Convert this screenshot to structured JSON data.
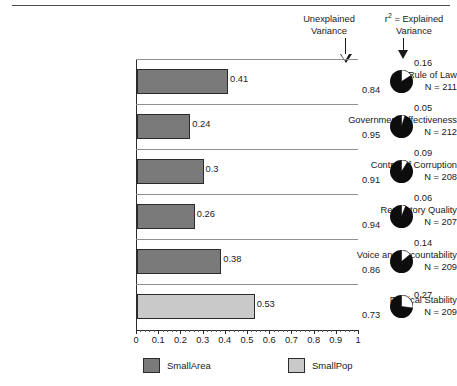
{
  "chart_data": {
    "type": "bar",
    "title": "",
    "xlabel": "",
    "ylabel": "",
    "xlim": [
      0,
      1
    ],
    "grid": true,
    "legend_position": "bottom",
    "categories": [
      "Rule of Law",
      "Government Effectiveness",
      "Control of Corruption",
      "Regulatory Quality",
      "Voice and Accountability",
      "Political Stability"
    ],
    "sample_sizes": [
      "N = 211",
      "N = 212",
      "N = 208",
      "N = 207",
      "N = 209",
      "N = 209"
    ],
    "values": [
      0.41,
      0.24,
      0.3,
      0.26,
      0.38,
      0.53
    ],
    "value_labels": [
      "0.41",
      "0.24",
      "0.3",
      "0.26",
      "0.38",
      "0.53"
    ],
    "series_of_row": [
      "SmallArea",
      "SmallArea",
      "SmallArea",
      "SmallArea",
      "SmallArea",
      "SmallPop"
    ],
    "explained_variance": [
      0.16,
      0.05,
      0.09,
      0.06,
      0.14,
      0.27
    ],
    "explained_labels": [
      "0.16",
      "0.05",
      "0.09",
      "0.06",
      "0.14",
      "0.27"
    ],
    "unexplained_variance": [
      0.84,
      0.95,
      0.91,
      0.94,
      0.86,
      0.73
    ],
    "unexplained_labels": [
      "0.84",
      "0.95",
      "0.91",
      "0.94",
      "0.86",
      "0.73"
    ],
    "xticks": [
      0,
      0.1,
      0.2,
      0.3,
      0.4,
      0.5,
      0.6,
      0.7,
      0.8,
      0.9,
      1
    ],
    "xtick_labels": [
      "0",
      "0.1",
      "0.2",
      "0.3",
      "0.4",
      "0.5",
      "0.6",
      "0.7",
      "0.8",
      "0.9",
      "1"
    ],
    "legend": [
      {
        "label": "SmallArea",
        "color": "#7a7a7a"
      },
      {
        "label": "SmallPop",
        "color": "#c9c9c9"
      }
    ],
    "colors": {
      "smallarea": "#7a7a7a",
      "smallpop": "#c9c9c9",
      "pie_unexplained": "#0d0d0d",
      "pie_explained": "#ffffff",
      "axis": "#2a2a2a",
      "gridline": "#8f8f8f"
    }
  },
  "annotations": {
    "unexplained": {
      "line1": "Unexplained",
      "line2": "Variance"
    },
    "explained": {
      "prefix": "r",
      "superscript": "2",
      "rest": "= Explained",
      "line2": "Variance"
    }
  },
  "legend": {
    "smallarea": "SmallArea",
    "smallpop": "SmallPop"
  }
}
